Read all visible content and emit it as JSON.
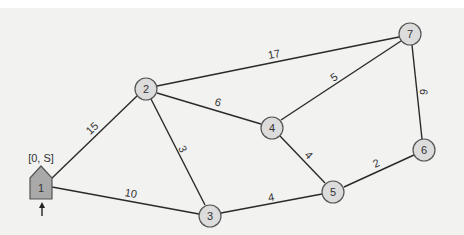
{
  "diagram": {
    "type": "weighted-undirected-graph",
    "source_label": "[0, S]",
    "start_arrow": "up-arrow",
    "nodes": [
      {
        "id": "1",
        "label": "1",
        "x": 40,
        "y": 188,
        "shape": "house",
        "color": "#a9a9a9"
      },
      {
        "id": "2",
        "label": "2",
        "x": 146,
        "y": 89,
        "shape": "circle",
        "color": "#dcdcdc"
      },
      {
        "id": "3",
        "label": "3",
        "x": 210,
        "y": 216,
        "shape": "circle",
        "color": "#dcdcdc"
      },
      {
        "id": "4",
        "label": "4",
        "x": 272,
        "y": 128,
        "shape": "circle",
        "color": "#dcdcdc"
      },
      {
        "id": "5",
        "label": "5",
        "x": 333,
        "y": 192,
        "shape": "circle",
        "color": "#dcdcdc"
      },
      {
        "id": "6",
        "label": "6",
        "x": 424,
        "y": 150,
        "shape": "circle",
        "color": "#dcdcdc"
      },
      {
        "id": "7",
        "label": "7",
        "x": 410,
        "y": 34,
        "shape": "circle",
        "color": "#dcdcdc"
      }
    ],
    "edges": [
      {
        "from": "1",
        "to": "2",
        "weight": "15"
      },
      {
        "from": "1",
        "to": "3",
        "weight": "10"
      },
      {
        "from": "2",
        "to": "3",
        "weight": "3"
      },
      {
        "from": "2",
        "to": "4",
        "weight": "6"
      },
      {
        "from": "2",
        "to": "7",
        "weight": "17"
      },
      {
        "from": "3",
        "to": "5",
        "weight": "4"
      },
      {
        "from": "4",
        "to": "5",
        "weight": "4"
      },
      {
        "from": "4",
        "to": "7",
        "weight": "5"
      },
      {
        "from": "5",
        "to": "6",
        "weight": "2"
      },
      {
        "from": "6",
        "to": "7",
        "weight": "6"
      }
    ]
  }
}
